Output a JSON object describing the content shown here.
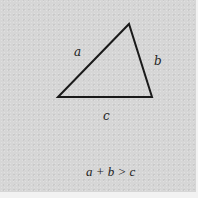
{
  "diagram": {
    "background_color": "#d6d6d6",
    "line_color": "#1a1a1a",
    "triangle": {
      "vertices": {
        "left": [
          58,
          97
        ],
        "top": [
          129,
          24
        ],
        "right": [
          152,
          97
        ]
      }
    },
    "labels": {
      "side_a": "a",
      "side_b": "b",
      "side_c": "c"
    },
    "caption": "a + b > c"
  }
}
